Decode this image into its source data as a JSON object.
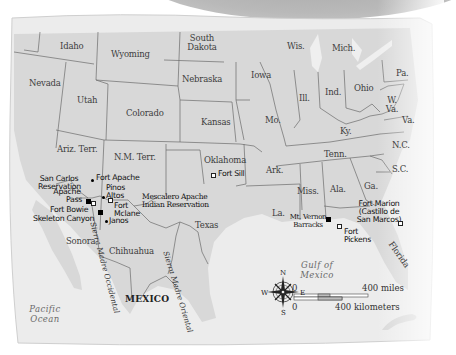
{
  "map": {
    "region": "Southwestern and Southern United States and Northern Mexico",
    "colors": {
      "land": "#dcdcdc",
      "water": "#efefef",
      "border": "#6b6b6b",
      "top_band": "#b0b0b0"
    },
    "states": [
      {
        "id": "idaho",
        "label": "Idaho"
      },
      {
        "id": "wyoming",
        "label": "Wyoming"
      },
      {
        "id": "south-dakota",
        "label": "South\nDakota",
        "line1": "South",
        "line2": "Dakota"
      },
      {
        "id": "wisconsin",
        "label": "Wis."
      },
      {
        "id": "michigan",
        "label": "Mich."
      },
      {
        "id": "nevada",
        "label": "Nevada"
      },
      {
        "id": "utah",
        "label": "Utah"
      },
      {
        "id": "nebraska",
        "label": "Nebraska"
      },
      {
        "id": "iowa",
        "label": "Iowa"
      },
      {
        "id": "illinois",
        "label": "Ill."
      },
      {
        "id": "indiana",
        "label": "Ind."
      },
      {
        "id": "ohio",
        "label": "Ohio"
      },
      {
        "id": "pennsylvania",
        "label": "Pa."
      },
      {
        "id": "west-virginia",
        "line1": "W.",
        "line2": "Va."
      },
      {
        "id": "virginia",
        "label": "Va."
      },
      {
        "id": "colorado",
        "label": "Colorado"
      },
      {
        "id": "kansas",
        "label": "Kansas"
      },
      {
        "id": "missouri",
        "label": "Mo."
      },
      {
        "id": "kentucky",
        "label": "Ky."
      },
      {
        "id": "arizona-territory",
        "label": "Ariz. Terr."
      },
      {
        "id": "new-mexico-territory",
        "label": "N.M. Terr."
      },
      {
        "id": "oklahoma",
        "label": "Oklahoma"
      },
      {
        "id": "arkansas",
        "label": "Ark."
      },
      {
        "id": "tennessee",
        "label": "Tenn."
      },
      {
        "id": "north-carolina",
        "label": "N.C."
      },
      {
        "id": "south-carolina",
        "label": "S.C."
      },
      {
        "id": "texas",
        "label": "Texas"
      },
      {
        "id": "louisiana",
        "label": "La."
      },
      {
        "id": "mississippi",
        "label": "Miss."
      },
      {
        "id": "alabama",
        "label": "Ala."
      },
      {
        "id": "georgia",
        "label": "Ga."
      },
      {
        "id": "florida",
        "label": "Florida"
      },
      {
        "id": "sonora",
        "label": "Sonora"
      },
      {
        "id": "chihuahua",
        "label": "Chihuahua"
      }
    ],
    "country": "MEXICO",
    "water_bodies": {
      "pacific": {
        "line1": "Pacific",
        "line2": "Ocean"
      },
      "gulf": {
        "line1": "Gulf of",
        "line2": "Mexico"
      }
    },
    "mountain_ranges": {
      "occidental": "Sierra Madre Occidental",
      "oriental": "Sierra Madre Oriental"
    },
    "sites": {
      "san_carlos": {
        "line1": "San Carlos",
        "line2": "Reservation",
        "marker": "none"
      },
      "fort_apache": {
        "label": "Fort Apache",
        "marker": "dot"
      },
      "pinos_altos": {
        "line1": "Pinos",
        "line2": "Altos",
        "marker": "dot"
      },
      "apache_pass": {
        "line1": "Apache",
        "line2": "Pass",
        "marker": "filled-square"
      },
      "fort_bowie": {
        "label": "Fort Bowie",
        "marker": "open-square"
      },
      "fort_mclane": {
        "line1": "Fort",
        "line2": "Mclane",
        "marker": "open-square"
      },
      "skeleton_canyon": {
        "label": "Skeleton Canyon",
        "marker": "filled-square"
      },
      "janos": {
        "label": "Janos",
        "marker": "dot"
      },
      "mescalero": {
        "line1": "Mescalero Apache",
        "line2": "Indian Reservation",
        "marker": "none"
      },
      "fort_sill": {
        "label": "Fort Sill",
        "marker": "open-square"
      },
      "mt_vernon": {
        "line1": "Mt. Vernon",
        "line2": "Barracks",
        "marker": "filled-square"
      },
      "fort_pickens": {
        "line1": "Fort",
        "line2": "Pickens",
        "marker": "open-square"
      },
      "fort_marion": {
        "line1": "Fort Marion",
        "line2": "(Castillo de",
        "line3": "San Marcos)",
        "marker": "open-square"
      }
    },
    "compass": {
      "n": "N",
      "s": "S",
      "e": "E",
      "w": "W"
    },
    "scale": {
      "miles_start": "0",
      "miles_end": "400 miles",
      "km_start": "0",
      "km_end": "400 kilometers"
    }
  }
}
